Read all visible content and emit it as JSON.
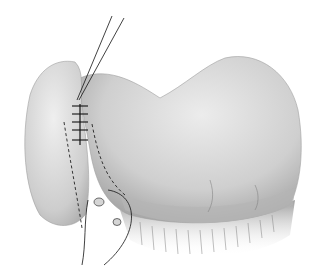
{
  "figure": {
    "style": "grayscale medical illustration",
    "background": "#ffffff",
    "colors": {
      "organ_light": "#e6e6e6",
      "organ_mid": "#bdbdbd",
      "organ_dark": "#8a8a8a",
      "line": "#1a1a1a"
    },
    "sutures": {
      "count": 5
    }
  }
}
